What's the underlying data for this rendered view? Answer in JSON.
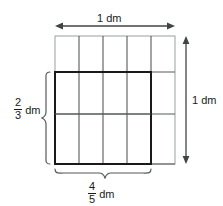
{
  "figure": {
    "unit": "dm",
    "grid": {
      "columns": 5,
      "rows": 3,
      "x0": 55,
      "y0": 36,
      "x1": 175,
      "y1": 164
    },
    "highlight": {
      "columns_covered": 4,
      "rows_covered": 2,
      "x0": 55,
      "y0": 72,
      "x1": 151,
      "y1": 164
    },
    "colors": {
      "grid_line": "#55595c",
      "outer_line": "#9aa0a4",
      "highlight_line": "#1a1a1a",
      "text": "#1a1a1a",
      "arrow": "#3f4447",
      "brace": "#55595c",
      "background": "#ffffff"
    }
  },
  "labels": {
    "top": {
      "value": "1",
      "unit": "dm",
      "text": "1 dm",
      "arrow": "double-headed-horizontal"
    },
    "right": {
      "value": "1",
      "unit": "dm",
      "text": "1 dm",
      "arrow": "double-headed-vertical"
    },
    "left": {
      "numerator": "2",
      "denominator": "3",
      "unit": "dm",
      "text": "2/3 dm",
      "marker": "curly-brace-left"
    },
    "bottom": {
      "numerator": "4",
      "denominator": "5",
      "unit": "dm",
      "text": "4/5 dm",
      "marker": "curly-brace-bottom"
    }
  }
}
